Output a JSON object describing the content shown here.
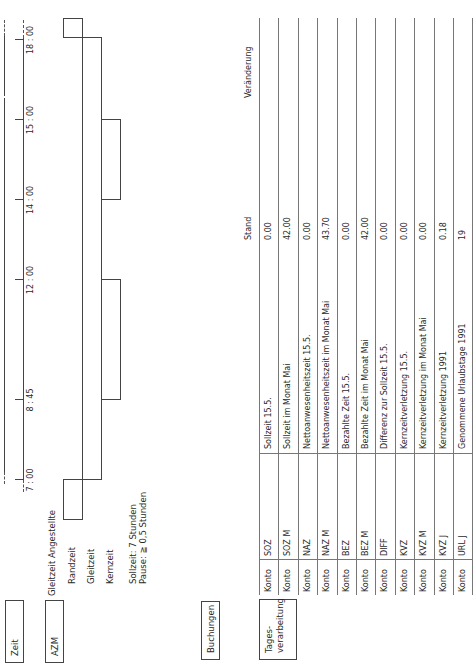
{
  "sections": {
    "zeit": "Zeit",
    "azm": "AZM",
    "buchungen": "Buchungen",
    "tagesverarbeitung": "Tages-\nverarbeitung",
    "tagesverarbeitung_line1": "Tages-",
    "tagesverarbeitung_line2": "verarbeitung"
  },
  "timeline": {
    "ticks": [
      {
        "label": "7 : 00",
        "x": 184
      },
      {
        "label": "8 : 45",
        "x": 264
      },
      {
        "label": "12 : 00",
        "x": 384
      },
      {
        "label": "14 : 00",
        "x": 464
      },
      {
        "label": "15 : 00",
        "x": 544
      },
      {
        "label": "18 : 00",
        "x": 624
      }
    ]
  },
  "azm": {
    "title": "Gleitzeit Angestellte",
    "rows": [
      "Randzeit",
      "Gleitzeit",
      "Kernzeit"
    ],
    "note_line1": "Sollzeit: 7 Stunden",
    "note_line2": "Pause: ≧ 0,5 Stunden"
  },
  "table": {
    "headers": {
      "stand": "Stand",
      "veraenderung": "Veränderung"
    },
    "rows": [
      {
        "type": "Konto",
        "code": "SOZ",
        "description": "Sollzeit 15.5.",
        "stand": "0.00",
        "veraenderung": ""
      },
      {
        "type": "Konto",
        "code": "SOZ M",
        "description": "Sollzeit im Monat Mai",
        "stand": "42.00",
        "veraenderung": ""
      },
      {
        "type": "Konto",
        "code": "NAZ",
        "description": "Nettoanwesenheitszeit 15.5.",
        "stand": "0.00",
        "veraenderung": ""
      },
      {
        "type": "Konto",
        "code": "NAZ M",
        "description": "Nettoanwesenheitszeit im Monat Mai",
        "stand": "43.70",
        "veraenderung": ""
      },
      {
        "type": "Konto",
        "code": "BEZ",
        "description": "Bezahlte Zeit 15.5.",
        "stand": "0.00",
        "veraenderung": ""
      },
      {
        "type": "Konto",
        "code": "BEZ M",
        "description": "Bezahlte Zeit im Monat Mai",
        "stand": "42.00",
        "veraenderung": ""
      },
      {
        "type": "Konto",
        "code": "DIFF",
        "description": "Differenz zur Sollzeit 15.5.",
        "stand": "0.00",
        "veraenderung": ""
      },
      {
        "type": "Konto",
        "code": "KVZ",
        "description": "Kernzeitverletzung 15.5.",
        "stand": "0.00",
        "veraenderung": ""
      },
      {
        "type": "Konto",
        "code": "KVZ M",
        "description": "Kernzeitverletzung im Monat Mai",
        "stand": "0.00",
        "veraenderung": ""
      },
      {
        "type": "Konto",
        "code": "KVZ J",
        "description": "Kernzeitverletzung 1991",
        "stand": "0.18",
        "veraenderung": ""
      },
      {
        "type": "Konto",
        "code": "URL J",
        "description": "Genommene Urlaubstage 1991",
        "stand": "19",
        "veraenderung": ""
      }
    ]
  },
  "colors": {
    "line": "#444444",
    "text": "#2a2a2a",
    "background": "#ffffff"
  }
}
